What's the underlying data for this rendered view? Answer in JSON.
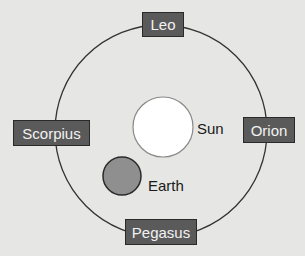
{
  "diagram": {
    "type": "orbit-diagram",
    "constellations": [
      {
        "name": "Leo",
        "position": "top"
      },
      {
        "name": "Orion",
        "position": "right"
      },
      {
        "name": "Pegasus",
        "position": "bottom"
      },
      {
        "name": "Scorpius",
        "position": "left"
      }
    ],
    "sun": {
      "label": "Sun",
      "color": "#ffffff"
    },
    "earth": {
      "label": "Earth",
      "color": "#8f8f8f"
    },
    "colors": {
      "background": "#e6e6e4",
      "orbit": "#333333",
      "label_box": "#5a5a5a",
      "label_text": "#f2f2f2"
    }
  }
}
